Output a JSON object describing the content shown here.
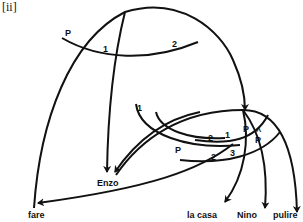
{
  "diagram": {
    "tag": "[ii]",
    "upper_structure": {
      "markers": [
        "P",
        "1",
        "2"
      ]
    },
    "lower_structure": {
      "markers": [
        "1",
        "P",
        "2",
        "1",
        "P",
        "̂P",
        "2",
        "3"
      ],
      "hat_p": "P",
      "hat": "^"
    },
    "nodes": {
      "enzo": "Enzo",
      "fare": "fare",
      "la_casa": "la casa",
      "nino": "Nino",
      "pulire": "pulire"
    },
    "colors": {
      "stroke": "#111111",
      "background": "#ffffff"
    }
  }
}
